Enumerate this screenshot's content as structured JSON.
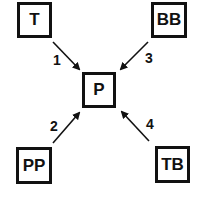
{
  "diagram": {
    "nodes": [
      {
        "id": "T",
        "label": "T"
      },
      {
        "id": "BB",
        "label": "BB"
      },
      {
        "id": "P",
        "label": "P"
      },
      {
        "id": "PP",
        "label": "PP"
      },
      {
        "id": "TB",
        "label": "TB"
      }
    ],
    "edges": [
      {
        "from": "T",
        "to": "P",
        "label": "1"
      },
      {
        "from": "PP",
        "to": "P",
        "label": "2"
      },
      {
        "from": "BB",
        "to": "P",
        "label": "3"
      },
      {
        "from": "TB",
        "to": "P",
        "label": "4"
      }
    ],
    "colors": {
      "stroke": "#111111",
      "background": "#ffffff"
    }
  }
}
